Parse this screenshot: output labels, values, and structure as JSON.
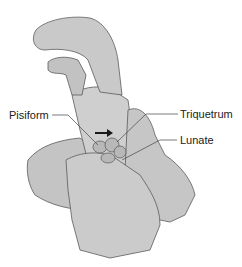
{
  "figure": {
    "labels": {
      "pisiform": "Pisiform",
      "triquetrum": "Triquetrum",
      "lunate": "Lunate"
    },
    "colors": {
      "skin_fill": "#c8c8c8",
      "skin_shade": "#a9a9a9",
      "outline": "#5a5a5a",
      "bone_fill": "#b5b5b5",
      "text": "#222222",
      "arrow": "#1a1a1a"
    }
  }
}
